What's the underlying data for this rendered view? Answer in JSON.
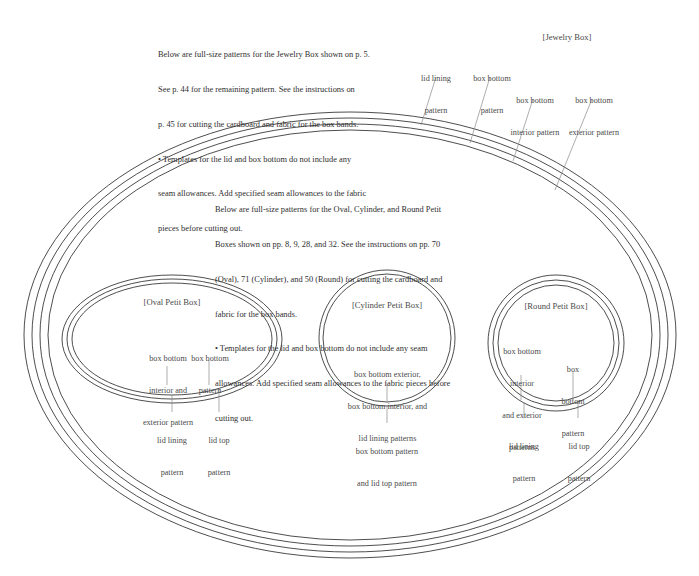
{
  "page": {
    "background_color": "#ffffff",
    "ink_color": "#3a3a3a"
  },
  "jewelry_box": {
    "title": "[Jewelry Box]",
    "intro_lines": [
      "Below are full-size patterns for the Jewelry Box shown on p. 5.",
      "See p. 44 for the remaining pattern. See the instructions on",
      "p. 45 for cutting the cardboard and fabric for the box bands.",
      "• Templates for the lid and box bottom do not include any",
      "seam allowances. Add specified seam allowances to the fabric",
      "pieces before cutting out."
    ],
    "callouts": [
      {
        "name": "lid-lining",
        "lines": [
          "lid lining",
          "pattern"
        ]
      },
      {
        "name": "box-bottom",
        "lines": [
          "box bottom",
          "pattern"
        ]
      },
      {
        "name": "box-bottom-interior",
        "lines": [
          "box bottom",
          "interior pattern"
        ]
      },
      {
        "name": "box-bottom-exterior",
        "lines": [
          "box bottom",
          "exterior pattern"
        ]
      }
    ]
  },
  "petit_boxes": {
    "intro_lines": [
      "Below are full-size patterns for the Oval, Cylinder, and Round Petit",
      "Boxes shown on pp. 8, 9, 28, and 32. See the instructions on pp. 70",
      "(Oval), 71 (Cylinder), and 50 (Round) for cutting the cardboard and",
      "fabric for the box bands.",
      "• Templates for the lid and box bottom do not include any seam",
      "allowances. Add specified seam allowances to the fabric pieces before",
      "cutting out."
    ],
    "oval": {
      "title": "[Oval Petit Box]",
      "callouts": [
        {
          "name": "box-bottom-interior-exterior",
          "lines": [
            "box bottom",
            "interior and",
            "exterior pattern"
          ]
        },
        {
          "name": "box-bottom",
          "lines": [
            "box bottom",
            "pattern"
          ]
        },
        {
          "name": "lid-lining",
          "lines": [
            "lid lining",
            "pattern"
          ]
        },
        {
          "name": "lid-top",
          "lines": [
            "lid top",
            "pattern"
          ]
        }
      ]
    },
    "cylinder": {
      "title": "[Cylinder Petit Box]",
      "callouts": [
        {
          "name": "combined-patterns",
          "lines": [
            "box bottom exterior,",
            "box bottom interior, and",
            "lid lining patterns"
          ]
        },
        {
          "name": "box-bottom-and-lid-top",
          "lines": [
            "box bottom pattern",
            "and lid top pattern"
          ]
        }
      ]
    },
    "round": {
      "title": "[Round Petit Box]",
      "callouts": [
        {
          "name": "box-bottom-interior-exterior",
          "lines": [
            "box bottom",
            "interior",
            "and exterior",
            "patterns"
          ]
        },
        {
          "name": "box-bottom",
          "lines": [
            "box",
            "bottom",
            "pattern"
          ]
        },
        {
          "name": "lid-lining",
          "lines": [
            "lid lining",
            "pattern"
          ]
        },
        {
          "name": "lid-top",
          "lines": [
            "lid top",
            "pattern"
          ]
        }
      ]
    }
  }
}
